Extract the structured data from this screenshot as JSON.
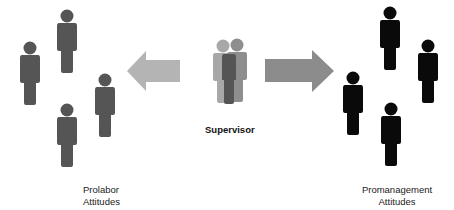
{
  "diagram": {
    "center": {
      "label": "Supervisor",
      "figure_colors": {
        "back_left": "#a8a8a8",
        "back_right": "#8e8e8e",
        "front": "#555555"
      }
    },
    "left_group": {
      "label_line1": "Prolabor",
      "label_line2": "Attitudes",
      "figure_color": "#555555",
      "arrow_color": "#b4b4b4",
      "arrow_direction": "left"
    },
    "right_group": {
      "label_line1": "Promanagement",
      "label_line2": "Attitudes",
      "figure_color": "#0a0a0a",
      "arrow_color": "#8c8c8c",
      "arrow_direction": "right"
    }
  }
}
